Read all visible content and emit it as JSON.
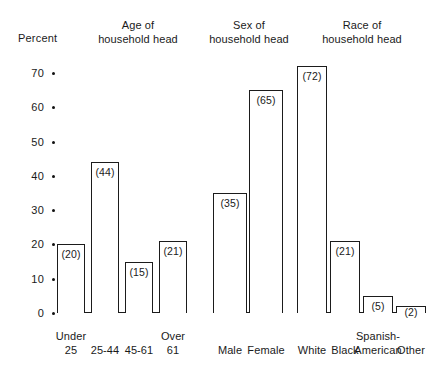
{
  "axis": {
    "y_title": "Percent",
    "ticks": [
      70,
      60,
      50,
      40,
      30,
      20,
      10,
      0
    ]
  },
  "groups": [
    {
      "title_line1": "Age of",
      "title_line2": "household head",
      "categories": [
        {
          "line1": "Under",
          "line2": "25",
          "value": 20,
          "label": "(20)"
        },
        {
          "line1": "25-44",
          "line2": "",
          "value": 44,
          "label": "(44)"
        },
        {
          "line1": "45-61",
          "line2": "",
          "value": 15,
          "label": "(15)"
        },
        {
          "line1": "Over",
          "line2": "61",
          "value": 21,
          "label": "(21)"
        }
      ]
    },
    {
      "title_line1": "Sex of",
      "title_line2": "household head",
      "categories": [
        {
          "line1": "Male",
          "line2": "",
          "value": 35,
          "label": "(35)"
        },
        {
          "line1": "Female",
          "line2": "",
          "value": 65,
          "label": "(65)"
        }
      ]
    },
    {
      "title_line1": "Race of",
      "title_line2": "household head",
      "categories": [
        {
          "line1": "White",
          "line2": "",
          "value": 72,
          "label": "(72)"
        },
        {
          "line1": "Black",
          "line2": "",
          "value": 21,
          "label": "(21)"
        },
        {
          "line1": "Spanish-",
          "line2": "American",
          "value": 5,
          "label": "(5)"
        },
        {
          "line1": "Other",
          "line2": "",
          "value": 2,
          "label": "(2)"
        }
      ]
    }
  ],
  "chart_data": {
    "type": "bar",
    "title": "",
    "xlabel": "",
    "ylabel": "Percent",
    "ylim": [
      0,
      75
    ],
    "yticks": [
      0,
      10,
      20,
      30,
      40,
      50,
      60,
      70
    ],
    "grid": false,
    "legend": "none",
    "panels": [
      {
        "name": "Age of household head",
        "categories": [
          "Under 25",
          "25-44",
          "45-61",
          "Over 61"
        ],
        "values": [
          20,
          44,
          15,
          21
        ]
      },
      {
        "name": "Sex of household head",
        "categories": [
          "Male",
          "Female"
        ],
        "values": [
          35,
          65
        ]
      },
      {
        "name": "Race of household head",
        "categories": [
          "White",
          "Black",
          "Spanish-American",
          "Other"
        ],
        "values": [
          72,
          21,
          5,
          2
        ]
      }
    ]
  }
}
